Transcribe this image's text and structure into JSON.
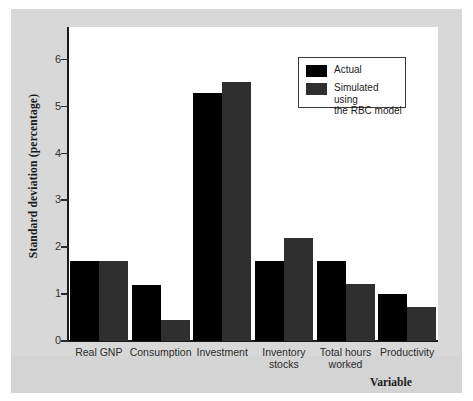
{
  "chart_data": {
    "type": "bar",
    "title": "",
    "xlabel": "Variable",
    "ylabel": "Standard deviation (percentage)",
    "ylim": [
      0,
      6.7
    ],
    "yticks": [
      0,
      1,
      2,
      3,
      4,
      5,
      6
    ],
    "ytick_labels": [
      "0",
      "1",
      "2",
      "3",
      "4",
      "5",
      "6"
    ],
    "grid": false,
    "legend_position": "top-right",
    "categories": [
      "Real GNP",
      "Consumption",
      "Investment",
      "Inventory\nstocks",
      "Total hours\nworked",
      "Productivity"
    ],
    "series": [
      {
        "name": "Actual",
        "color": "#000000",
        "values": [
          1.71,
          1.2,
          5.3,
          1.71,
          1.71,
          1.0
        ]
      },
      {
        "name": "Simulated using\nthe RBC model",
        "color": "#2f2f2f",
        "values": [
          1.71,
          0.45,
          5.53,
          2.2,
          1.22,
          0.72
        ]
      }
    ]
  },
  "legend": {
    "entries": [
      {
        "label": "Actual",
        "swatch": "#000000"
      },
      {
        "label": "Simulated using\nthe RBC model",
        "swatch": "#2f2f2f"
      }
    ]
  },
  "colors": {
    "figure_background": "#d8d8d8",
    "plot_background": "#ffffff",
    "axis": "#1a1a1a",
    "actual_bar": "#000000",
    "simulated_bar": "#2f2f2f"
  }
}
